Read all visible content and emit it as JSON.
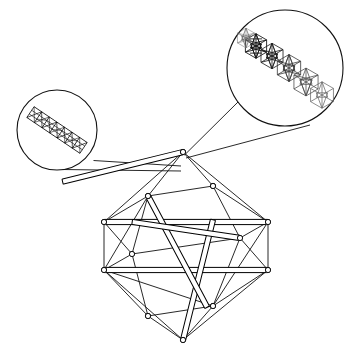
{
  "figure": {
    "background_color": "#ffffff",
    "line_color": "#111111",
    "width": 354,
    "height": 354,
    "has_text_labels": false
  },
  "main_structure": {
    "name": "tensegrity-icosahedron",
    "description": "Icosahedral tensegrity: six compression struts held apart by a network of tension cables",
    "vertex_count": 12,
    "cable_count": 24,
    "strut_count": 6,
    "center": [
      186,
      246
    ],
    "radius": 104,
    "strut_thickness": 5.2,
    "vertices": [
      {
        "id": "v0",
        "x": 104.0,
        "y": 222.0
      },
      {
        "id": "v1",
        "x": 268.0,
        "y": 222.0
      },
      {
        "id": "v2",
        "x": 104.0,
        "y": 270.0
      },
      {
        "id": "v3",
        "x": 268.0,
        "y": 270.0
      },
      {
        "id": "v4",
        "x": 183.0,
        "y": 152.0
      },
      {
        "id": "v5",
        "x": 183.0,
        "y": 340.0
      },
      {
        "id": "v6",
        "x": 213.0,
        "y": 186.0
      },
      {
        "id": "v7",
        "x": 213.0,
        "y": 306.0
      },
      {
        "id": "v8",
        "x": 148.0,
        "y": 196.0
      },
      {
        "id": "v9",
        "x": 148.0,
        "y": 316.0
      },
      {
        "id": "v10",
        "x": 240.0,
        "y": 238.0
      },
      {
        "id": "v11",
        "x": 132.0,
        "y": 254.0
      }
    ],
    "struts": [
      {
        "id": "s1",
        "from": "v0",
        "to": "v1",
        "axis": "horizontal-upper"
      },
      {
        "id": "s2",
        "from": "v2",
        "to": "v3",
        "axis": "horizontal-lower"
      },
      {
        "id": "s3",
        "from": "v4",
        "to": "v9",
        "axis": "diagonal-left"
      },
      {
        "id": "s4",
        "from": "v5",
        "to": "v6",
        "axis": "diagonal-right"
      },
      {
        "id": "s5",
        "from": "v8",
        "to": "v7",
        "axis": "diagonal-cross"
      },
      {
        "id": "s6",
        "from": "v10",
        "to": "v11",
        "axis": "depth"
      }
    ]
  },
  "callouts": [
    {
      "id": "callout-strut",
      "name": "magnified-strut-lattice",
      "position": "left",
      "center": [
        57,
        130
      ],
      "radius": 40,
      "content_label": "triangulated lattice truss strut",
      "content_type": "truss-tube",
      "bay_count": 7,
      "anchor": [
        180,
        168
      ]
    },
    {
      "id": "callout-chain",
      "name": "magnified-icosahedra-chain",
      "position": "right",
      "center": [
        285,
        68
      ],
      "radius": 58,
      "content_label": "chain of smaller icosahedra",
      "content_type": "icosahedra-chain",
      "unit_count": 6,
      "gradient": "darker and denser toward upper-left",
      "anchor": [
        186,
        156
      ]
    }
  ],
  "chart_data": {
    "type": "diagram",
    "levels": [
      {
        "level": 1,
        "label": "tensegrity icosahedron",
        "element_count": 6
      },
      {
        "level": 2,
        "label": "lattice truss strut",
        "element_count": 7
      },
      {
        "level": 3,
        "label": "chain of icosahedra",
        "element_count": 6
      }
    ]
  }
}
